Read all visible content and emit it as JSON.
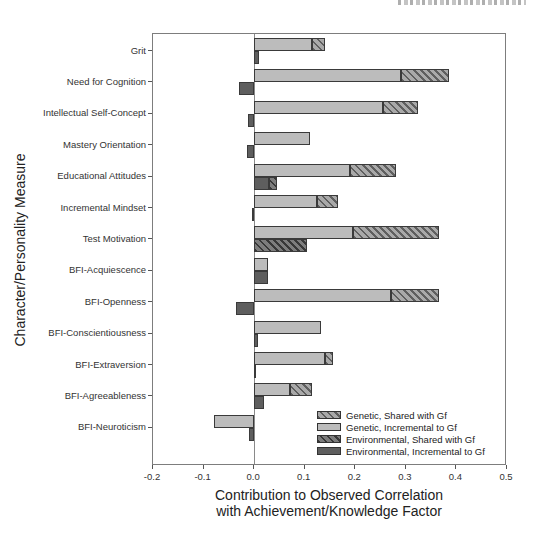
{
  "chart_data": {
    "type": "bar",
    "orientation": "horizontal",
    "xlabel": "Contribution to Observed Correlation with Achievement/Knowledge Factor",
    "xlabel_lines": [
      "Contribution to Observed Correlation",
      "with Achievement/Knowledge Factor"
    ],
    "ylabel": "Character/Personality Measure",
    "xlim": [
      -0.2,
      0.5
    ],
    "xticks": [
      "-0.2",
      "-0.1",
      "0.0",
      "0.1",
      "0.2",
      "0.3",
      "0.4",
      "0.5"
    ],
    "xtick_values": [
      -0.2,
      -0.1,
      0.0,
      0.1,
      0.2,
      0.3,
      0.4,
      0.5
    ],
    "grid": false,
    "legend_position": "lower right",
    "categories": [
      "Grit",
      "Need for Cognition",
      "Intellectual Self-Concept",
      "Mastery Orientation",
      "Educational Attitudes",
      "Incremental Mindset",
      "Test Motivation",
      "BFI-Acquiescence",
      "BFI-Openness",
      "BFI-Conscientiousness",
      "BFI-Extraversion",
      "BFI-Agreeableness",
      "BFI-Neuroticism"
    ],
    "series": [
      {
        "name": "Genetic, Incremental to Gf",
        "bar": "genetic",
        "style": "solid-light",
        "values": [
          0.115,
          0.29,
          0.255,
          0.11,
          0.19,
          0.125,
          0.195,
          0.028,
          0.27,
          0.133,
          0.14,
          0.07,
          -0.08
        ]
      },
      {
        "name": "Genetic, Shared with Gf",
        "bar": "genetic",
        "style": "hatched-light",
        "values": [
          0.025,
          0.095,
          0.07,
          0,
          0.09,
          0.04,
          0.17,
          0,
          0.095,
          0,
          0.015,
          0.045,
          0
        ]
      },
      {
        "name": "Environmental, Incremental to Gf",
        "bar": "environmental",
        "style": "solid-dark",
        "values": [
          0.01,
          -0.03,
          -0.012,
          -0.015,
          0.03,
          -0.005,
          0,
          0.027,
          -0.035,
          0.008,
          0.004,
          0.02,
          -0.01
        ]
      },
      {
        "name": "Environmental, Shared with Gf",
        "bar": "environmental",
        "style": "hatched-dark",
        "values": [
          0,
          0,
          0,
          0,
          0.015,
          0,
          0.105,
          0,
          0,
          0,
          0,
          0,
          0
        ]
      }
    ],
    "legend": [
      {
        "label": "Genetic, Shared with Gf",
        "style": "hatched-light"
      },
      {
        "label": "Genetic, Incremental to Gf",
        "style": "solid-light"
      },
      {
        "label": "Environmental, Shared with Gf",
        "style": "hatched-dark"
      },
      {
        "label": "Environmental, Incremental to Gf",
        "style": "solid-dark"
      }
    ]
  },
  "colors": {
    "background": "#ffffff",
    "bar_light": "#bcbcbc",
    "bar_dark": "#5e5e5e",
    "bar_border": "#3a3a3a",
    "axis": "#7d7d7d",
    "text": "#222222"
  }
}
